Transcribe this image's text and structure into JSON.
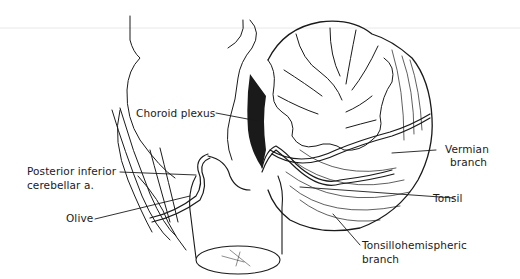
{
  "figure": {
    "labels": {
      "choroid_plexus": "Choroid plexus",
      "vermian_branch_line1": "Vermian",
      "vermian_branch_line2": "branch",
      "pica_line1": "Posterior inferior",
      "pica_line2": "cerebellar a.",
      "tonsil": "Tonsil",
      "olive": "Olive",
      "tonsillohemispheric_line1": "Tonsillohemispheric",
      "tonsillohemispheric_line2": "branch"
    },
    "colors": {
      "ink": "#1a1a1a",
      "background": "#ffffff",
      "rule": "#e6e6e6"
    }
  }
}
